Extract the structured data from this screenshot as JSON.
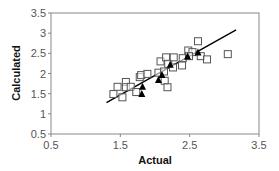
{
  "chart_data": {
    "type": "scatter",
    "title": "",
    "xlabel": "Actual",
    "ylabel": "Calculated",
    "xlim": [
      0.5,
      3.5
    ],
    "ylim": [
      0.5,
      3.5
    ],
    "x_ticks": [
      "0.5",
      "1.5",
      "2.5",
      "3.5"
    ],
    "y_ticks": [
      "0.5",
      "1",
      "1.5",
      "2",
      "2.5",
      "3",
      "3.5"
    ],
    "grid": false,
    "legend": "none",
    "series": [
      {
        "name": "open squares",
        "marker": "square-open",
        "color": "#555555",
        "points": [
          [
            1.4,
            1.49
          ],
          [
            1.46,
            1.67
          ],
          [
            1.53,
            1.41
          ],
          [
            1.58,
            1.79
          ],
          [
            1.58,
            1.66
          ],
          [
            1.65,
            1.67
          ],
          [
            1.73,
            1.54
          ],
          [
            1.78,
            1.91
          ],
          [
            1.8,
            1.96
          ],
          [
            1.89,
            1.99
          ],
          [
            2.05,
            2.02
          ],
          [
            2.08,
            2.3
          ],
          [
            2.13,
            2.05
          ],
          [
            2.14,
            1.82
          ],
          [
            2.18,
            1.66
          ],
          [
            2.16,
            2.4
          ],
          [
            2.19,
            2.24
          ],
          [
            2.27,
            2.4
          ],
          [
            2.26,
            2.15
          ],
          [
            2.39,
            2.2
          ],
          [
            2.4,
            2.38
          ],
          [
            2.48,
            2.57
          ],
          [
            2.54,
            2.53
          ],
          [
            2.49,
            2.43
          ],
          [
            2.62,
            2.8
          ],
          [
            2.66,
            2.43
          ],
          [
            2.75,
            2.35
          ],
          [
            3.05,
            2.48
          ]
        ]
      },
      {
        "name": "filled triangles",
        "marker": "triangle-filled",
        "color": "#000000",
        "points": [
          [
            1.82,
            1.67
          ],
          [
            1.81,
            1.49
          ],
          [
            2.05,
            1.84
          ],
          [
            2.1,
            1.96
          ],
          [
            2.22,
            2.22
          ],
          [
            2.47,
            2.42
          ],
          [
            2.62,
            2.52
          ]
        ]
      }
    ],
    "fit_line": {
      "x": [
        1.3,
        3.17
      ],
      "y": [
        1.28,
        3.08
      ],
      "color": "#000000"
    }
  }
}
